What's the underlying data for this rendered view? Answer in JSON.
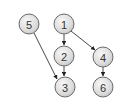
{
  "diagram": {
    "type": "directed-graph",
    "nodes": [
      {
        "id": "5",
        "label": "5",
        "cx": 29,
        "cy": 24
      },
      {
        "id": "1",
        "label": "1",
        "cx": 64,
        "cy": 24
      },
      {
        "id": "2",
        "label": "2",
        "cx": 64,
        "cy": 56
      },
      {
        "id": "4",
        "label": "4",
        "cx": 103,
        "cy": 57
      },
      {
        "id": "3",
        "label": "3",
        "cx": 65,
        "cy": 87
      },
      {
        "id": "6",
        "label": "6",
        "cx": 103,
        "cy": 87
      }
    ],
    "edges": [
      {
        "from": "5",
        "to": "3"
      },
      {
        "from": "1",
        "to": "2"
      },
      {
        "from": "1",
        "to": "4"
      },
      {
        "from": "2",
        "to": "3"
      },
      {
        "from": "4",
        "to": "6"
      }
    ],
    "colors": {
      "node_fill_light": "#f2f2f2",
      "node_fill_dark": "#c8c8c8",
      "node_stroke": "#6b6b6b",
      "edge": "#333333",
      "label": "#333333"
    }
  }
}
